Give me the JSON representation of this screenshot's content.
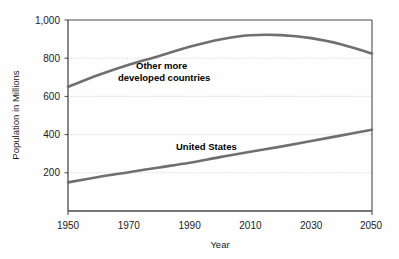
{
  "chart_data": {
    "type": "line",
    "title": "",
    "xlabel": "Year",
    "ylabel": "Population in Millions",
    "xlim": [
      1950,
      2050
    ],
    "ylim": [
      0,
      1000
    ],
    "xticks": [
      "1950",
      "1970",
      "1990",
      "2010",
      "2030",
      "2050"
    ],
    "xtick_values": [
      1950,
      1970,
      1990,
      2010,
      2030,
      2050
    ],
    "yticks": [
      "200",
      "400",
      "600",
      "800",
      "1,000"
    ],
    "ytick_values": [
      200,
      400,
      600,
      800,
      1000
    ],
    "grid": "horizontal-dotted",
    "legend_position": "inline-annotation",
    "line_color": "#6f6f6f",
    "frame_color": "#3a3a3a",
    "grid_color": "#c9c9c9",
    "background": "#fefefe",
    "x": [
      1950,
      1960,
      1970,
      1980,
      1990,
      2000,
      2010,
      2020,
      2030,
      2040,
      2050
    ],
    "series": [
      {
        "name": "Other more developed countries",
        "label_line1": "Other more",
        "label_line2": "developed countries",
        "values": [
          650,
          712,
          766,
          812,
          860,
          898,
          920,
          921,
          905,
          872,
          825
        ]
      },
      {
        "name": "United States",
        "label_line1": "United States",
        "label_line2": "",
        "values": [
          150,
          178,
          203,
          228,
          253,
          282,
          310,
          337,
          366,
          396,
          425
        ]
      }
    ]
  }
}
